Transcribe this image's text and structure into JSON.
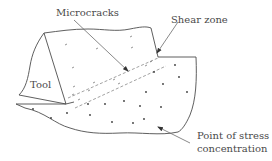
{
  "diagram": {
    "labels": {
      "microcracks": "Microcracks",
      "shear_zone": "Shear zone",
      "tool": "Tool",
      "stress_line1": "Point of stress",
      "stress_line2": "concentration"
    },
    "colors": {
      "outline": "#4d4d4d",
      "dashed": "#8a8a8a",
      "arrow": "#6b6b6b",
      "dot": "#3a3a3a",
      "text": "#4a4a4a",
      "background": "#ffffff"
    }
  }
}
